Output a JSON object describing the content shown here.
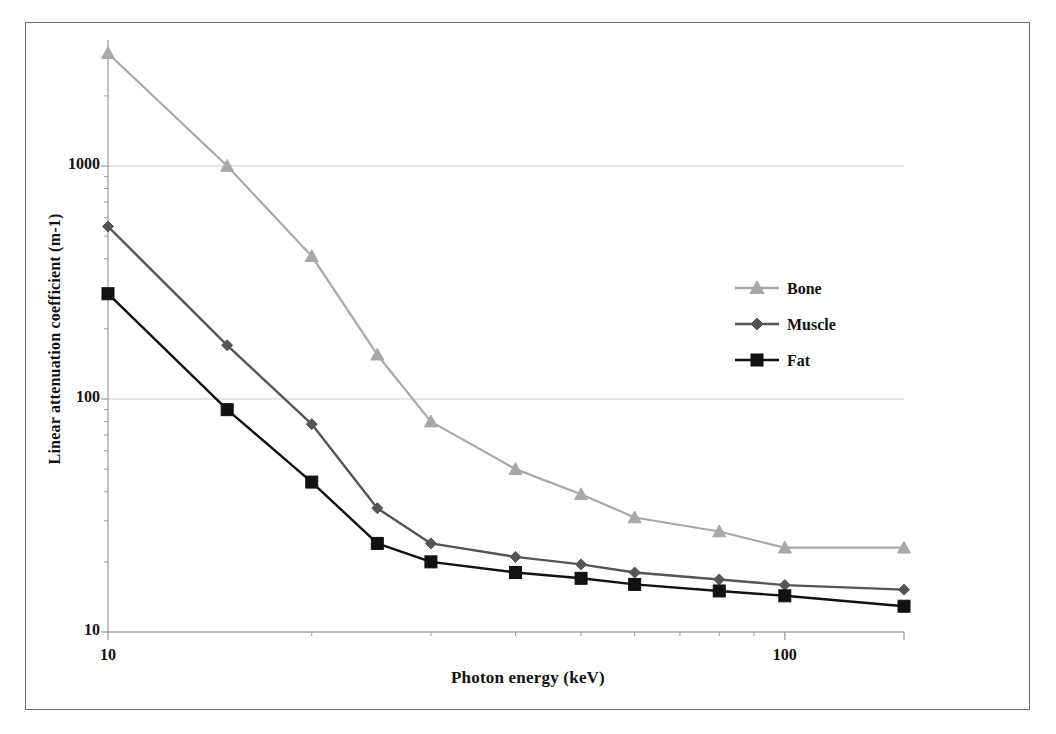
{
  "chart_data": {
    "type": "line",
    "title": "",
    "xlabel": "Photon energy (keV)",
    "ylabel": "Linear attenuation coefficient (m-1)",
    "xscale": "log",
    "yscale": "log",
    "xlim": [
      10,
      150
    ],
    "ylim": [
      10,
      3500
    ],
    "grid": "horizontal-major",
    "legend_position": "center-right",
    "x": [
      10,
      15,
      20,
      25,
      30,
      40,
      50,
      60,
      80,
      100,
      150
    ],
    "xticks": [
      {
        "value": 10,
        "label": "10"
      },
      {
        "value": 100,
        "label": "100"
      }
    ],
    "xminorticks": [
      20,
      30,
      40,
      50,
      60,
      70,
      80,
      90,
      150
    ],
    "yticks": [
      {
        "value": 10,
        "label": "10"
      },
      {
        "value": 100,
        "label": "100"
      },
      {
        "value": 1000,
        "label": "1000"
      }
    ],
    "series": [
      {
        "name": "Bone",
        "color": "#a8a8a8",
        "marker": "triangle",
        "values": [
          3050,
          1000,
          410,
          155,
          80,
          50,
          39,
          31,
          27,
          23,
          23
        ]
      },
      {
        "name": "Muscle",
        "color": "#555558",
        "marker": "diamond",
        "values": [
          550,
          170,
          78,
          34,
          24,
          21,
          19.5,
          18,
          16.8,
          15.9,
          15.2
        ]
      },
      {
        "name": "Fat",
        "color": "#111111",
        "marker": "square",
        "values": [
          283,
          90,
          44,
          24,
          20,
          18,
          17,
          16,
          15,
          14.3,
          12.9
        ]
      }
    ]
  },
  "legend": {
    "items": [
      {
        "label": "Bone"
      },
      {
        "label": "Muscle"
      },
      {
        "label": "Fat"
      }
    ]
  },
  "axes": {
    "x_title": "Photon energy (keV)",
    "y_title": "Linear attenuation coefficient (m-1)"
  },
  "colors": {
    "bone": "#a8a8a8",
    "muscle": "#555558",
    "fat": "#111111",
    "grid": "#c9c9cc",
    "axis": "#9a9a9e",
    "frame": "#6e6e72",
    "background": "#ffffff"
  }
}
